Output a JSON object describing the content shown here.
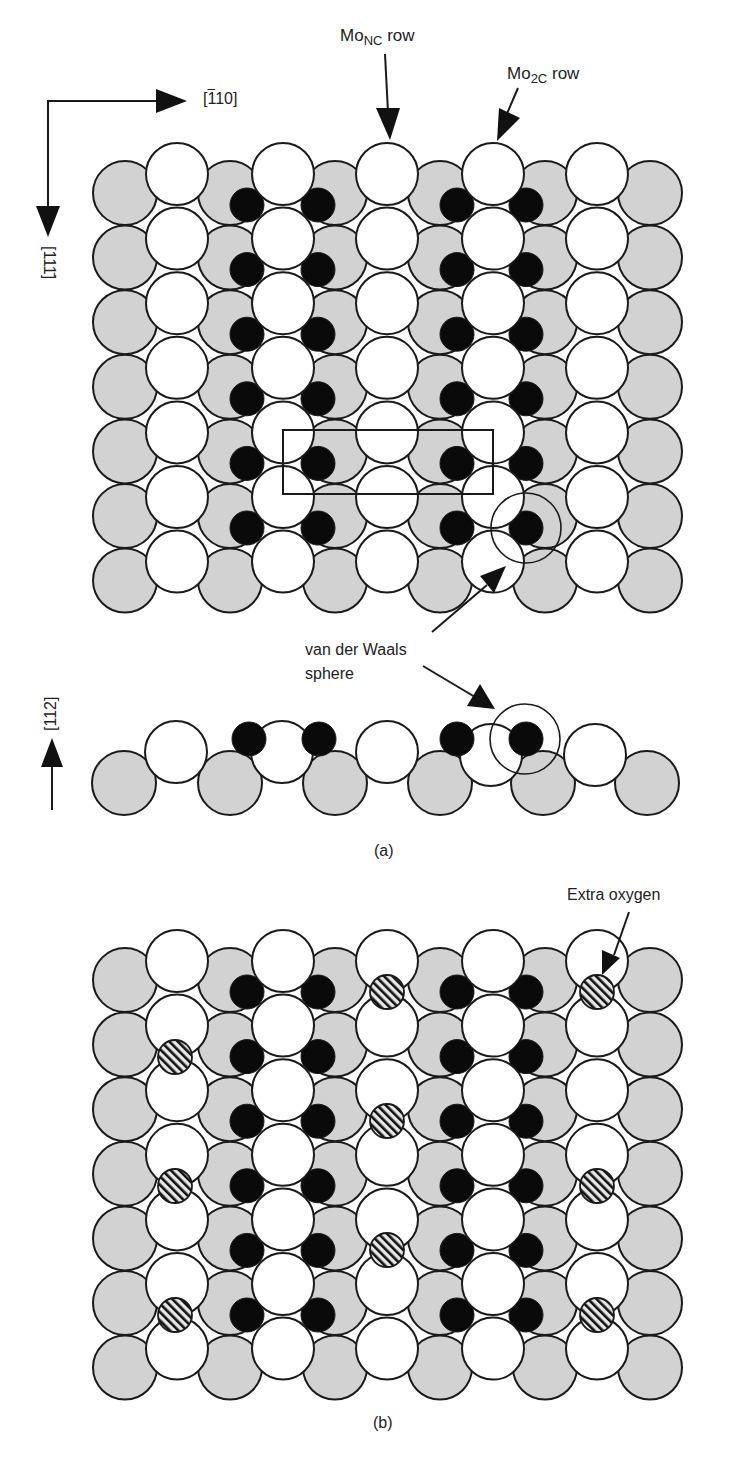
{
  "figure": {
    "width": 729,
    "height": 1467,
    "colors": {
      "background": "#ffffff",
      "outline": "#1a1a1a",
      "substrate_atom": "#d2d2d2",
      "surface_atom": "#ffffff",
      "carbon_atom": "#0a0a0a",
      "extra_oxygen_stripe": "#111111",
      "extra_oxygen_bg": "#e6e6e6"
    },
    "legend_labels": {
      "gray": "substrate Mo atom (second layer)",
      "white": "surface Mo atom",
      "black": "C atom",
      "hatched": "extra oxygen atom"
    }
  },
  "axes": {
    "horizontal": {
      "label": "[1̄10]",
      "text_main": "[",
      "text_bar": "1",
      "text_rest": "10]"
    },
    "vertical": {
      "label": "[111̄]"
    },
    "side": {
      "label": "[112]"
    }
  },
  "labels": {
    "mo_nc_row": {
      "base": "Mo",
      "sub": "NC",
      "suffix": " row"
    },
    "mo_2c_row": {
      "base": "Mo",
      "sub": "2C",
      "suffix": " row"
    },
    "vdw_line1": "van der Waals",
    "vdw_line2": "sphere",
    "extra_oxygen": "Extra oxygen",
    "panel_a": "(a)",
    "panel_b": "(b)"
  },
  "lattice": {
    "gray_x": [
      125,
      230,
      335,
      440,
      545,
      650
    ],
    "white_x": [
      177,
      283,
      387,
      493,
      597
    ],
    "black_x": [
      247,
      318,
      457,
      526
    ],
    "gray_r": 32,
    "white_r": 31,
    "black_r": 17,
    "row_pitch": 64.6,
    "gray_rows": 7,
    "white_rows": 7,
    "black_rows": 6
  },
  "panel_a": {
    "gray_y0": 193,
    "white_y0": 174,
    "black_y0": 205,
    "unit_cell_rect": {
      "x": 283,
      "y": 430,
      "w": 210,
      "h": 64
    },
    "vdw_circle": {
      "cx": 526,
      "cy": 528,
      "r": 35
    }
  },
  "side_view": {
    "gray": [
      [
        124,
        783
      ],
      [
        230,
        783
      ],
      [
        335,
        783
      ],
      [
        440,
        783
      ],
      [
        543,
        783
      ],
      [
        647,
        783
      ]
    ],
    "white": [
      [
        176,
        752
      ],
      [
        282,
        752
      ],
      [
        387,
        752
      ],
      [
        491,
        755
      ],
      [
        595,
        755
      ]
    ],
    "black": [
      [
        249,
        739
      ],
      [
        319,
        739
      ],
      [
        457,
        739
      ],
      [
        526,
        739
      ]
    ],
    "vdw_circle": {
      "cx": 525,
      "cy": 739,
      "r": 35
    }
  },
  "panel_b": {
    "gray_y0": 980,
    "white_y0": 961,
    "black_y0": 992,
    "extra_oxygen": [
      [
        175,
        1057
      ],
      [
        175,
        1186
      ],
      [
        175,
        1315
      ],
      [
        387,
        992
      ],
      [
        387,
        1121
      ],
      [
        387,
        1250
      ],
      [
        597,
        992
      ],
      [
        597,
        1186
      ],
      [
        597,
        1315
      ]
    ],
    "extra_oxygen_r": 17
  }
}
